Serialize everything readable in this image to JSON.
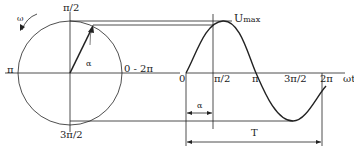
{
  "labels": {
    "omega": "ω",
    "top": "π/2",
    "left": "π",
    "right": "0 - 2π",
    "bottom": "3π/2",
    "alpha_circle": "α",
    "umax": "U",
    "umax_sub": "max",
    "zero": "0",
    "pi_half": "π/2",
    "pi": "π",
    "three_pi_half": "3π/2",
    "two_pi": "2π",
    "omega_t": "ωt",
    "alpha_wave": "α",
    "period": "T"
  },
  "colors": {
    "line": "#222222",
    "bg": "#ffffff"
  }
}
